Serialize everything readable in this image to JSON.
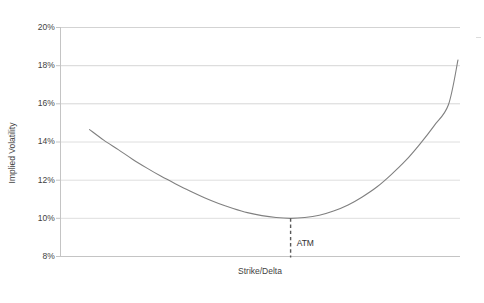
{
  "chart_data": {
    "type": "line",
    "title": "",
    "subtitle": "",
    "xlabel": "Strike/Delta",
    "ylabel": "Implied Volatility",
    "ylim": [
      8,
      20
    ],
    "ytick_labels": [
      "8%",
      "10%",
      "12%",
      "14%",
      "16%",
      "18%",
      "20%"
    ],
    "ytick_values": [
      8,
      10,
      12,
      14,
      16,
      18,
      20
    ],
    "xtick_labels": [],
    "grid": "horizontal",
    "legend": "none",
    "series": [
      {
        "name": "Implied volatility smile",
        "color": "#808080",
        "x": [
          0.038,
          0.075,
          0.113,
          0.15,
          0.188,
          0.225,
          0.263,
          0.3,
          0.338,
          0.375,
          0.413,
          0.45,
          0.488,
          0.525,
          0.563,
          0.6,
          0.638,
          0.675,
          0.713,
          0.75,
          0.788,
          0.825,
          0.863,
          0.9,
          0.938,
          0.975,
          1.0
        ],
        "values": [
          14.65,
          14.1,
          13.6,
          13.1,
          12.63,
          12.2,
          11.8,
          11.43,
          11.08,
          10.78,
          10.52,
          10.3,
          10.14,
          10.04,
          10.0,
          10.04,
          10.16,
          10.38,
          10.7,
          11.12,
          11.64,
          12.28,
          13.02,
          13.88,
          14.86,
          15.95,
          18.3
        ]
      }
    ],
    "annotations": [
      {
        "name": "atm-marker",
        "label": "ATM",
        "x": 0.563,
        "y_top": 10.0,
        "y_bottom": 8.0,
        "style": "dashed-vertical-line",
        "color": "#595959"
      }
    ]
  },
  "axis": {
    "y_title": "Implied Volatility",
    "x_title": "Strike/Delta",
    "ticks": [
      {
        "label": "20%"
      },
      {
        "label": "18%"
      },
      {
        "label": "16%"
      },
      {
        "label": "14%"
      },
      {
        "label": "12%"
      },
      {
        "label": "10%"
      },
      {
        "label": "8%"
      }
    ]
  },
  "annotation": {
    "atm_label": "ATM"
  },
  "caption": {
    "cropped_text": " "
  },
  "colors": {
    "curve": "#808080",
    "gridline": "#d9d9d9",
    "axis": "#bfbfbf",
    "atm_line": "#595959",
    "text": "#3f3f3f",
    "background": "#ffffff"
  }
}
